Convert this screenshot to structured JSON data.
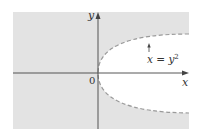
{
  "figure": {
    "type": "region-plot",
    "colors": {
      "shaded_region": "#e3e3e3",
      "unshaded_region": "#ffffff",
      "axis": "#444444",
      "boundary": "#9a9a9a",
      "text": "#333333"
    },
    "axes": {
      "x_label": "x",
      "y_label": "y",
      "origin_label": "0"
    },
    "curve": {
      "label": "x = y",
      "label_exponent": "2",
      "equation": "x = y^2",
      "style": "dashed"
    }
  }
}
